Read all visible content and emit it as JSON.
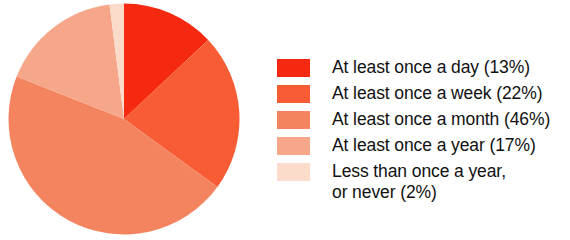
{
  "chart_data": {
    "type": "pie",
    "title": "",
    "subtitle": "",
    "xlabel": "",
    "ylabel": "",
    "grid": false,
    "legend_position": "right",
    "start_angle_deg": 0,
    "direction": "clockwise",
    "unit": "%",
    "categories": [
      "At least once a day",
      "At least once a week",
      "At least once a month",
      "At least once a year",
      "Less than once a year, or never"
    ],
    "values": [
      13,
      22,
      46,
      17,
      2
    ],
    "labels": [
      "At least once a day (13%)",
      "At least once a week (22%)",
      "At least once a month (46%)",
      "Less than once a year,\nor never (2%)"
    ],
    "colors": [
      "#F5290F",
      "#F75C34",
      "#F4845F",
      "#F7A789",
      "#FBDCCB"
    ],
    "slices": [
      {
        "label": "At least once a day",
        "value": 13,
        "color": "#F5290F"
      },
      {
        "label": "At least once a week",
        "value": 22,
        "color": "#F75C34"
      },
      {
        "label": "At least once a month",
        "value": 46,
        "color": "#F4845F"
      },
      {
        "label": "At least once a year",
        "value": 17,
        "color": "#F7A789"
      },
      {
        "label": "Less than once a year, or never",
        "value": 2,
        "color": "#FBDCCB"
      }
    ]
  },
  "legend": {
    "items": [
      {
        "swatch_color": "#F5290F",
        "label": "At least once a day (13%)"
      },
      {
        "swatch_color": "#F75C34",
        "label": "At least once a week (22%)"
      },
      {
        "swatch_color": "#F4845F",
        "label": "At least once a month (46%)"
      },
      {
        "swatch_color": "#F7A789",
        "label": "At least once a year (17%)"
      },
      {
        "swatch_color": "#FBDCCB",
        "label": "Less than once a year,\nor never (2%)"
      }
    ]
  }
}
